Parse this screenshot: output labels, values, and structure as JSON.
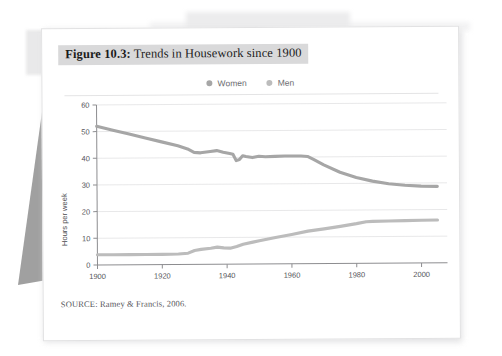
{
  "figure": {
    "number_label": "Figure 10.3:",
    "title_text": " Trends in Housework since 1900",
    "source": "SOURCE: Ramey & Francis, 2006."
  },
  "legend": {
    "items": [
      {
        "label": "Women",
        "color": "#a6a6a6",
        "icon": "circle-marker"
      },
      {
        "label": "Men",
        "color": "#bcbcbc",
        "icon": "circle-marker"
      }
    ]
  },
  "chart_data": {
    "type": "line",
    "title": "Figure 10.3: Trends in Housework since 1900",
    "xlabel": "",
    "ylabel": "Hours per week",
    "xlim": [
      1900,
      2008
    ],
    "ylim": [
      0,
      60
    ],
    "xticks": [
      1900,
      1920,
      1940,
      1960,
      1980,
      2000
    ],
    "yticks": [
      0,
      10,
      20,
      30,
      40,
      50,
      60
    ],
    "grid": "horizontal",
    "legend_position": "top-center",
    "series": [
      {
        "name": "Women",
        "color": "#a6a6a6",
        "x": [
          1900,
          1905,
          1910,
          1915,
          1920,
          1925,
          1928,
          1930,
          1932,
          1935,
          1937,
          1939,
          1941,
          1942,
          1943,
          1944,
          1945,
          1946,
          1948,
          1950,
          1952,
          1955,
          1958,
          1960,
          1963,
          1965,
          1967,
          1970,
          1975,
          1980,
          1985,
          1990,
          1995,
          2000,
          2005
        ],
        "y": [
          52.0,
          50.5,
          49.0,
          47.5,
          46.0,
          44.5,
          43.3,
          42.0,
          41.8,
          42.3,
          42.6,
          42.0,
          41.5,
          41.2,
          38.8,
          39.2,
          40.6,
          40.3,
          39.9,
          40.4,
          40.2,
          40.3,
          40.4,
          40.4,
          40.4,
          40.2,
          39.0,
          37.0,
          34.2,
          32.2,
          30.8,
          29.8,
          29.2,
          28.8,
          28.7
        ]
      },
      {
        "name": "Men",
        "color": "#bcbcbc",
        "x": [
          1900,
          1905,
          1910,
          1915,
          1920,
          1925,
          1928,
          1930,
          1932,
          1935,
          1937,
          1939,
          1941,
          1943,
          1945,
          1948,
          1950,
          1955,
          1960,
          1965,
          1970,
          1975,
          1980,
          1983,
          1985,
          1990,
          1995,
          2000,
          2005
        ],
        "y": [
          3.8,
          3.8,
          3.8,
          3.8,
          3.8,
          3.9,
          4.2,
          5.2,
          5.6,
          6.0,
          6.4,
          6.1,
          6.0,
          6.6,
          7.4,
          8.2,
          8.7,
          9.9,
          11.0,
          12.2,
          13.0,
          13.9,
          14.9,
          15.6,
          15.7,
          15.8,
          15.9,
          16.0,
          16.1
        ]
      }
    ]
  }
}
